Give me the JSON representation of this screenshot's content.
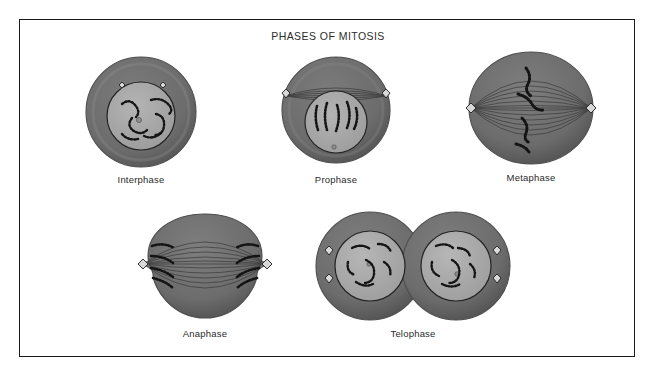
{
  "figure": {
    "title": "PHASES OF MITOSIS",
    "border_color": "#1a1a1a",
    "background": "#ffffff"
  },
  "palette": {
    "cytoplasm": "#6e6e6e",
    "cytoplasm_edge": "#5a5a5a",
    "cytoplasm_rim": "#8a8a8a",
    "nucleus": "#a8a8a8",
    "nucleus_outline": "#2a2a2a",
    "chromatin": "#141414",
    "centriole_fill": "#d8d8d8",
    "centriole_outline": "#1f1f1f",
    "spindle": "#4a4a4a",
    "nucleolus": "#8e8e8e"
  },
  "phases": [
    {
      "id": "interphase",
      "label": "Interphase",
      "description": "Single round cell with intact nucleus containing loose chromatin threads and two centrioles near the top of the cytoplasm.",
      "centrioles": 2,
      "nucleus_present": true,
      "spindle_present": false,
      "cell_count": 1,
      "chromosome_groups": 1
    },
    {
      "id": "prophase",
      "label": "Prophase",
      "description": "Centrioles have migrated to opposite poles; spindle fibers arc between them above the nucleus, whose chromatin has condensed into visible chromosomes.",
      "centrioles": 2,
      "nucleus_present": true,
      "spindle_present": true,
      "cell_count": 1,
      "chromosome_groups": 1
    },
    {
      "id": "metaphase",
      "label": "Metaphase",
      "description": "Nuclear envelope gone; chromosomes line up along the cell equator with spindle fibers running pole to pole.",
      "centrioles": 2,
      "nucleus_present": false,
      "spindle_present": true,
      "cell_count": 1,
      "chromosome_groups": 4
    },
    {
      "id": "anaphase",
      "label": "Anaphase",
      "description": "Sister chromatids are pulled apart toward opposite poles; the cell elongates and begins to pinch at the middle.",
      "centrioles": 2,
      "nucleus_present": false,
      "spindle_present": true,
      "cell_count": 1,
      "chromosome_groups": 2
    },
    {
      "id": "telophase",
      "label": "Telophase",
      "description": "Two daughter cells form, each with a reassembled nucleus of decondensing chromatin and two centrioles in the cytoplasm.",
      "centrioles": 4,
      "nucleus_present": true,
      "spindle_present": false,
      "cell_count": 2,
      "chromosome_groups": 2
    }
  ]
}
